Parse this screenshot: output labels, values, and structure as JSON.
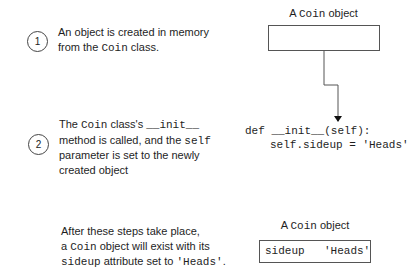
{
  "steps": [
    {
      "number": "1",
      "lines": [
        {
          "a": "An object is created in memory"
        },
        {
          "a": "from the ",
          "code": "Coin",
          "b": " class."
        }
      ]
    },
    {
      "number": "2",
      "lines": [
        {
          "a": "The ",
          "code": "Coin",
          "b": " class's ",
          "code2": "__init__"
        },
        {
          "a": "method is called, and the ",
          "code": "self"
        },
        {
          "a": "parameter is set to the newly"
        },
        {
          "a": "created object"
        }
      ]
    }
  ],
  "result": {
    "lines": [
      {
        "a": "After these steps take place,"
      },
      {
        "a": "a ",
        "code": "Coin",
        "b": " object will exist with its"
      },
      {
        "code": "sideup",
        "b": " attribute set to ",
        "code2": "'Heads'",
        "c": "."
      }
    ]
  },
  "top_object": {
    "title_prefix": "A ",
    "title_code": "Coin",
    "title_suffix": " object"
  },
  "init_code": {
    "line1": "def __init__(self):",
    "line2": "self.sideup = 'Heads'"
  },
  "bottom_object": {
    "title_prefix": "A ",
    "title_code": "Coin",
    "title_suffix": " object",
    "attribute": "sideup",
    "value": "'Heads'"
  }
}
